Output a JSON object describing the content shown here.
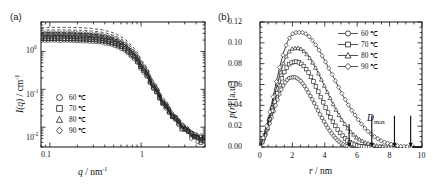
{
  "figure": {
    "background": "#ffffff",
    "foreground": "#1a1a1a",
    "width": 433,
    "height": 187
  },
  "panel_a": {
    "label": "(a)",
    "xlabel_main": "q",
    "xlabel_unit": "/ nm",
    "xlabel_exp": "-1",
    "ylabel_main": "I(q)",
    "ylabel_unit": "/ cm",
    "ylabel_exp": "-1",
    "xticks": [
      "0.1",
      "1"
    ],
    "yticks": [
      "10",
      "10",
      "10"
    ],
    "yexps": [
      "0",
      "-1",
      "-2"
    ],
    "legend": [
      {
        "marker": "circle",
        "label": "60 ℃"
      },
      {
        "marker": "square",
        "label": "70 ℃"
      },
      {
        "marker": "triangle",
        "label": "80 ℃"
      },
      {
        "marker": "diamond",
        "label": "90 ℃"
      }
    ]
  },
  "panel_b": {
    "label": "(b)",
    "xlabel_main": "r",
    "xlabel_unit": "/ nm",
    "ylabel_main": "p(r)",
    "ylabel_unit": "[a.u.]",
    "xticks": [
      "0",
      "2",
      "4",
      "6",
      "8",
      "10"
    ],
    "yticks": [
      "0.00",
      "0.02",
      "0.04",
      "0.06",
      "0.08",
      "0.10",
      "0.12"
    ],
    "annotation": {
      "text": "D",
      "sub": "max"
    },
    "legend": [
      {
        "marker": "circle",
        "label": "60 ℃"
      },
      {
        "marker": "square",
        "label": "70 ℃"
      },
      {
        "marker": "triangle",
        "label": "80 ℃"
      },
      {
        "marker": "diamond",
        "label": "90 ℃"
      }
    ]
  },
  "chart_data": [
    {
      "type": "line",
      "panel": "a",
      "title": "",
      "xlabel": "q / nm^-1",
      "ylabel": "I(q) / cm^-1",
      "xscale": "log",
      "yscale": "log",
      "xlim": [
        0.08,
        5.0
      ],
      "ylim": [
        0.003,
        6.0
      ],
      "xticks": [
        0.1,
        1
      ],
      "yticks": [
        1,
        0.1,
        0.01
      ],
      "grid": false,
      "legend_position": "lower-left",
      "series": [
        {
          "name": "60 ℃",
          "marker": "circle",
          "fit": "dashed",
          "plateau": 1.95,
          "x": [
            0.1,
            0.13,
            0.17,
            0.22,
            0.28,
            0.36,
            0.46,
            0.6,
            0.77,
            1.0,
            1.29,
            1.66,
            2.15,
            2.78,
            3.59,
            4.5
          ],
          "y": [
            1.95,
            1.94,
            1.92,
            1.89,
            1.84,
            1.74,
            1.55,
            1.21,
            0.76,
            0.33,
            0.118,
            0.043,
            0.018,
            0.0092,
            0.0056,
            0.0043
          ]
        },
        {
          "name": "70 ℃",
          "marker": "square",
          "fit": "dashed",
          "plateau": 2.25,
          "x": [
            0.1,
            0.13,
            0.17,
            0.22,
            0.28,
            0.36,
            0.46,
            0.6,
            0.77,
            1.0,
            1.29,
            1.66,
            2.15,
            2.78,
            3.59,
            4.5
          ],
          "y": [
            2.25,
            2.24,
            2.21,
            2.17,
            2.1,
            1.98,
            1.76,
            1.37,
            0.85,
            0.36,
            0.126,
            0.0455,
            0.019,
            0.0097,
            0.0059,
            0.0046
          ]
        },
        {
          "name": "80 ℃",
          "marker": "triangle",
          "fit": "dashed",
          "plateau": 2.65,
          "x": [
            0.1,
            0.13,
            0.17,
            0.22,
            0.28,
            0.36,
            0.46,
            0.6,
            0.77,
            1.0,
            1.29,
            1.66,
            2.15,
            2.78,
            3.59,
            4.5
          ],
          "y": [
            2.65,
            2.63,
            2.6,
            2.55,
            2.46,
            2.31,
            2.04,
            1.57,
            0.96,
            0.4,
            0.138,
            0.049,
            0.0202,
            0.0103,
            0.0063,
            0.0049
          ]
        },
        {
          "name": "90 ℃",
          "marker": "diamond",
          "fit": "dashed",
          "plateau": 3.1,
          "x": [
            0.1,
            0.13,
            0.17,
            0.22,
            0.28,
            0.36,
            0.46,
            0.6,
            0.77,
            1.0,
            1.29,
            1.66,
            2.15,
            2.78,
            3.59,
            4.5
          ],
          "y": [
            3.1,
            3.08,
            3.04,
            2.98,
            2.87,
            2.69,
            2.36,
            1.8,
            1.09,
            0.445,
            0.15,
            0.0525,
            0.0215,
            0.011,
            0.0067,
            0.0052
          ]
        }
      ]
    },
    {
      "type": "line",
      "panel": "b",
      "title": "",
      "xlabel": "r / nm",
      "ylabel": "p(r) [a.u.]",
      "xscale": "linear",
      "yscale": "linear",
      "xlim": [
        0,
        10
      ],
      "ylim": [
        0.0,
        0.12
      ],
      "xticks": [
        0,
        2,
        4,
        6,
        8,
        10
      ],
      "yticks": [
        0.0,
        0.02,
        0.04,
        0.06,
        0.08,
        0.1,
        0.12
      ],
      "grid": false,
      "legend_position": "upper-right",
      "annotations": [
        {
          "label": "D_max",
          "arrows_at_r": [
            5.5,
            6.9,
            8.3,
            9.3
          ]
        }
      ],
      "series": [
        {
          "name": "60 ℃",
          "marker": "circle",
          "peak_r": 2.15,
          "peak_p": 0.067,
          "dmax": 5.5,
          "r": [
            0.0,
            0.25,
            0.5,
            0.75,
            1.0,
            1.25,
            1.5,
            1.75,
            2.0,
            2.15,
            2.25,
            2.5,
            2.75,
            3.0,
            3.25,
            3.5,
            3.75,
            4.0,
            4.25,
            4.5,
            4.75,
            5.0,
            5.25,
            5.5,
            5.75,
            6.0
          ],
          "p": [
            0.0,
            0.008,
            0.018,
            0.03,
            0.042,
            0.053,
            0.061,
            0.066,
            0.067,
            0.067,
            0.0665,
            0.0635,
            0.0585,
            0.052,
            0.045,
            0.0375,
            0.03,
            0.023,
            0.0168,
            0.0115,
            0.007,
            0.0038,
            0.0015,
            0.0002,
            0.0,
            0.0
          ]
        },
        {
          "name": "70 ℃",
          "marker": "square",
          "peak_r": 2.3,
          "peak_p": 0.082,
          "dmax": 6.9,
          "r": [
            0.0,
            0.25,
            0.5,
            0.75,
            1.0,
            1.25,
            1.5,
            1.75,
            2.0,
            2.3,
            2.5,
            2.75,
            3.0,
            3.25,
            3.5,
            3.75,
            4.0,
            4.25,
            4.5,
            4.75,
            5.0,
            5.25,
            5.5,
            5.75,
            6.0,
            6.25,
            6.5,
            6.9
          ],
          "p": [
            0.0,
            0.009,
            0.021,
            0.035,
            0.049,
            0.062,
            0.072,
            0.079,
            0.0815,
            0.082,
            0.0805,
            0.077,
            0.0715,
            0.0645,
            0.0565,
            0.048,
            0.0395,
            0.0315,
            0.0242,
            0.0178,
            0.0125,
            0.0082,
            0.005,
            0.0028,
            0.0014,
            0.0006,
            0.0002,
            0.0
          ]
        },
        {
          "name": "80 ℃",
          "marker": "triangle",
          "peak_r": 2.45,
          "peak_p": 0.095,
          "dmax": 8.3,
          "r": [
            0.0,
            0.25,
            0.5,
            0.75,
            1.0,
            1.25,
            1.5,
            1.75,
            2.0,
            2.25,
            2.45,
            2.75,
            3.0,
            3.25,
            3.5,
            3.75,
            4.0,
            4.25,
            4.5,
            4.75,
            5.0,
            5.5,
            6.0,
            6.5,
            7.0,
            7.5,
            8.0,
            8.3
          ],
          "p": [
            0.0,
            0.01,
            0.024,
            0.04,
            0.056,
            0.071,
            0.083,
            0.091,
            0.0945,
            0.095,
            0.095,
            0.0915,
            0.087,
            0.081,
            0.074,
            0.066,
            0.0578,
            0.0495,
            0.0415,
            0.034,
            0.0272,
            0.016,
            0.0085,
            0.0042,
            0.0018,
            0.0007,
            0.0002,
            0.0
          ]
        },
        {
          "name": "90 ℃",
          "marker": "diamond",
          "peak_r": 2.6,
          "peak_p": 0.11,
          "dmax": 9.3,
          "r": [
            0.0,
            0.25,
            0.5,
            0.75,
            1.0,
            1.25,
            1.5,
            1.75,
            2.0,
            2.25,
            2.6,
            2.85,
            3.1,
            3.4,
            3.7,
            4.0,
            4.3,
            4.6,
            4.9,
            5.2,
            5.6,
            6.0,
            6.5,
            7.0,
            7.5,
            8.0,
            8.6,
            9.3
          ],
          "p": [
            0.0,
            0.011,
            0.026,
            0.044,
            0.062,
            0.079,
            0.093,
            0.103,
            0.1085,
            0.11,
            0.11,
            0.1085,
            0.105,
            0.099,
            0.0915,
            0.083,
            0.074,
            0.065,
            0.056,
            0.0472,
            0.0366,
            0.0275,
            0.0175,
            0.0105,
            0.0058,
            0.0028,
            0.0008,
            0.0
          ]
        }
      ]
    }
  ]
}
